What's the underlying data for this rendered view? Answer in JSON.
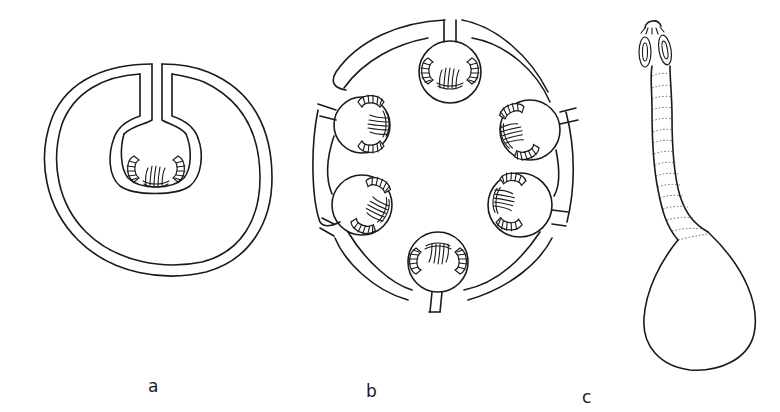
{
  "figure": {
    "panels": [
      {
        "id": "a",
        "label": "a",
        "description": "single invaginated scolex within a fluid-filled bladder"
      },
      {
        "id": "b",
        "label": "b",
        "description": "bladder with six invaginated scolices budding from the wall"
      },
      {
        "id": "c",
        "label": "c",
        "description": "evaginated scolex with suckers and hook crown, segmented neck attached to bladder"
      }
    ],
    "colors": {
      "line": "#1a1a1a",
      "background": "#ffffff"
    }
  }
}
